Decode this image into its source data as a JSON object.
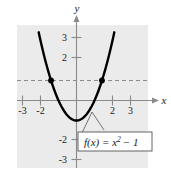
{
  "figure": {
    "title": "",
    "background_color": "#ffffff",
    "plot_background_color": "#ebebeb"
  },
  "axes": {
    "x_axis_label": "x",
    "y_axis_label": "y",
    "axis_color": "#808080",
    "x_tick_labels": [
      "-3",
      "-2",
      "2",
      "3"
    ],
    "x_tick_values": [
      -3,
      -2,
      2,
      3
    ],
    "y_tick_labels": [
      "3",
      "2",
      "-2",
      "-3"
    ],
    "y_tick_values": [
      3,
      2,
      -2,
      -3
    ]
  },
  "annotation": {
    "function_label": "f(x) = x",
    "function_exponent": "2",
    "function_tail": "− 1",
    "box_border_color": "#555555",
    "box_fill_color": "#ffffff"
  },
  "chart_data": {
    "type": "line",
    "title": "",
    "xlabel": "x",
    "ylabel": "y",
    "xlim": [
      -3.6,
      3.6
    ],
    "ylim": [
      -3.6,
      3.9
    ],
    "grid": false,
    "legend": "none",
    "series": [
      {
        "name": "f(x) = x^2 - 1",
        "kind": "parabola",
        "color": "#000000",
        "equation": "y = x^2 - 1",
        "vertex": [
          0,
          -1
        ],
        "x": [
          -2.1,
          -1.8,
          -1.5,
          -1.2,
          -0.9,
          -0.6,
          -0.3,
          0,
          0.3,
          0.6,
          0.9,
          1.2,
          1.5,
          1.8,
          2.1
        ],
        "y": [
          3.41,
          2.24,
          1.25,
          0.44,
          -0.19,
          -0.64,
          -0.91,
          -1,
          -0.91,
          -0.64,
          -0.19,
          0.44,
          1.25,
          2.24,
          3.41
        ]
      },
      {
        "name": "y = 1",
        "kind": "horizontal-dashed",
        "color": "#808080",
        "equation": "y = 1",
        "y_value": 1
      }
    ],
    "points": [
      {
        "label": "",
        "x": -1.414,
        "y": 1,
        "color": "#000000"
      },
      {
        "label": "",
        "x": 1.414,
        "y": 1,
        "color": "#000000"
      }
    ],
    "annotations": [
      {
        "text": "f(x) = x² − 1",
        "x": 0.6,
        "y": -2.1,
        "boxed": true
      }
    ]
  }
}
